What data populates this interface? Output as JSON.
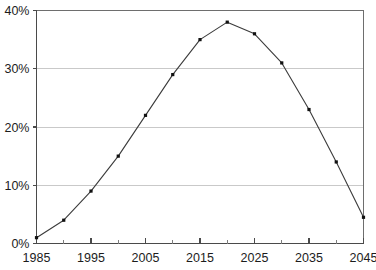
{
  "chart_data": {
    "type": "line",
    "title": "",
    "subtitle": "",
    "xlabel": "",
    "ylabel": "",
    "xlim": [
      1985,
      2045
    ],
    "ylim": [
      0,
      40
    ],
    "grid": true,
    "legend": false,
    "legend_position": "none",
    "x_tick_labels": [
      "1985",
      "1995",
      "2005",
      "2015",
      "2025",
      "2035",
      "2045"
    ],
    "x_tick_values": [
      1985,
      1995,
      2005,
      2015,
      2025,
      2035,
      2045
    ],
    "x_minor_tick_values": [
      1990,
      2000,
      2010,
      2020,
      2030,
      2040
    ],
    "y_tick_labels": [
      "0%",
      "10%",
      "20%",
      "30%",
      "40%"
    ],
    "y_tick_values": [
      0,
      10,
      20,
      30,
      40
    ],
    "series": [
      {
        "name": "series-1",
        "color": "#3b3b3b",
        "marker": "square",
        "x": [
          1985,
          1990,
          1995,
          2000,
          2005,
          2010,
          2015,
          2020,
          2025,
          2030,
          2035,
          2040,
          2045
        ],
        "values": [
          1,
          4,
          9,
          15,
          22,
          29,
          35,
          38,
          36,
          31,
          23,
          14,
          4.5
        ]
      }
    ]
  },
  "axes": {
    "y_unit": "%",
    "x_unit": "year"
  }
}
